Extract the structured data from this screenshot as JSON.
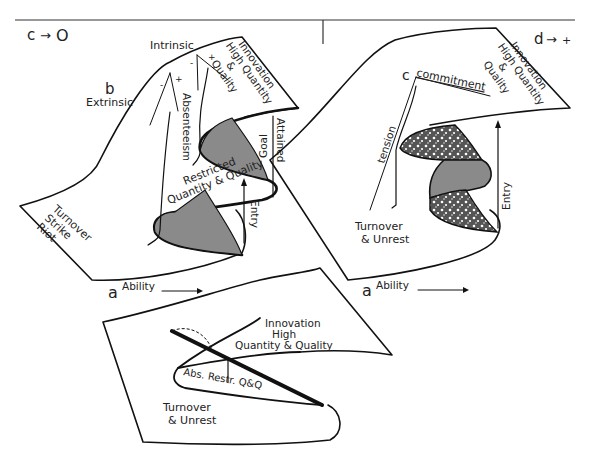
{
  "figure": {
    "panels": [
      {
        "id": "panel-c0",
        "corner_label": "c",
        "corner_arrow": "→",
        "corner_value": "O",
        "point_b": "b",
        "point_a": "a",
        "labels": {
          "intrinsic": "Intrinsic",
          "extrinsic": "Extrinsic",
          "minus1": "-",
          "plus1": "+",
          "minus2": "-",
          "plus2": "+",
          "innovation_line1": "Innovation",
          "innovation_line2": "High Quantity",
          "innovation_line3": "&",
          "innovation_line4": "Quality",
          "absenteeism": "Absenteeism",
          "restricted_line1": "Restricted",
          "restricted_line2": "Quantity & Quality",
          "goal_line1": "Goal",
          "goal_line2": "Attained",
          "entry": "Entry",
          "turnover_line1": "Turnover",
          "turnover_line2": "Strike",
          "turnover_line3": "Riot",
          "ability": "Ability"
        }
      },
      {
        "id": "panel-d",
        "corner_label": "d",
        "corner_arrow": "→",
        "corner_value": "+",
        "point_c": "c",
        "point_a": "a",
        "labels": {
          "commitment": "commitment",
          "innovation_line1": "Innovation",
          "innovation_line2": "High Quantity",
          "innovation_line3": "&",
          "innovation_line4": "Quality",
          "tension": "tension",
          "entry": "Entry",
          "turnover_line1": "Turnover",
          "turnover_line2": "& Unrest",
          "ability": "Ability"
        }
      },
      {
        "id": "panel-bottom",
        "labels": {
          "innovation_line1": "Innovation",
          "innovation_line2": "High",
          "innovation_line3": "Quantity & Quality",
          "abs_restr": "Abs. Restr. Q&Q",
          "turnover_line1": "Turnover",
          "turnover_line2": "& Unrest"
        }
      }
    ],
    "colors": {
      "ink": "#111111",
      "shade": "#8a8a8a",
      "background": "#ffffff"
    }
  }
}
